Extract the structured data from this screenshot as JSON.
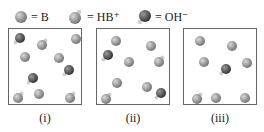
{
  "legend": [
    {
      "symbol": "B",
      "text": "= B",
      "icon": "gray-sphere-icon"
    },
    {
      "symbol": "HB+",
      "text": "= HB⁺",
      "icon": "gray-sphere-with-hydrogen-icon"
    },
    {
      "symbol": "OH-",
      "text": "= OH⁻",
      "icon": "dark-sphere-with-hydrogen-icon"
    }
  ],
  "colors": {
    "B": "#8a8a8a",
    "HB": "#8a8a8a",
    "O": "#4a4a4a",
    "H": "#c8c8c8",
    "border": "#666666"
  },
  "panels": [
    {
      "label": "(i)",
      "particles": [
        {
          "type": "OH",
          "x": 11,
          "y": 9
        },
        {
          "type": "HB",
          "x": 33,
          "y": 16
        },
        {
          "type": "B",
          "x": 67,
          "y": 10
        },
        {
          "type": "B",
          "x": 16,
          "y": 28
        },
        {
          "type": "B",
          "x": 50,
          "y": 29
        },
        {
          "type": "OH",
          "x": 60,
          "y": 41
        },
        {
          "type": "OH",
          "x": 24,
          "y": 49
        },
        {
          "type": "HB",
          "x": 9,
          "y": 69
        },
        {
          "type": "B",
          "x": 30,
          "y": 65
        },
        {
          "type": "HB",
          "x": 61,
          "y": 69
        }
      ]
    },
    {
      "label": "(ii)",
      "particles": [
        {
          "type": "B",
          "x": 19,
          "y": 12
        },
        {
          "type": "B",
          "x": 54,
          "y": 17
        },
        {
          "type": "OH",
          "x": 11,
          "y": 26
        },
        {
          "type": "B",
          "x": 32,
          "y": 33
        },
        {
          "type": "HB",
          "x": 62,
          "y": 33
        },
        {
          "type": "B",
          "x": 20,
          "y": 54
        },
        {
          "type": "B",
          "x": 50,
          "y": 58
        },
        {
          "type": "OH",
          "x": 64,
          "y": 64
        },
        {
          "type": "HB",
          "x": 9,
          "y": 70
        }
      ]
    },
    {
      "label": "(iii)",
      "particles": [
        {
          "type": "B",
          "x": 16,
          "y": 12
        },
        {
          "type": "B",
          "x": 48,
          "y": 17
        },
        {
          "type": "B",
          "x": 20,
          "y": 33
        },
        {
          "type": "OH",
          "x": 42,
          "y": 40
        },
        {
          "type": "B",
          "x": 63,
          "y": 34
        },
        {
          "type": "HB",
          "x": 13,
          "y": 70
        },
        {
          "type": "B",
          "x": 32,
          "y": 69
        },
        {
          "type": "B",
          "x": 61,
          "y": 69
        }
      ]
    }
  ]
}
